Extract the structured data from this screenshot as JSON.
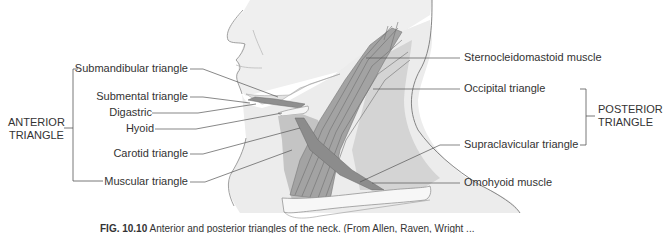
{
  "figure": {
    "groups": {
      "anterior": "ANTERIOR\nTRIANGLE",
      "anterior_line1": "ANTERIOR",
      "anterior_line2": "TRIANGLE",
      "posterior_line1": "POSTERIOR",
      "posterior_line2": "TRIANGLE"
    },
    "left_labels": {
      "submandibular": "Submandibular triangle",
      "submental": "Submental triangle",
      "digastric": "Digastric",
      "hyoid": "Hyoid",
      "carotid": "Carotid triangle",
      "muscular": "Muscular triangle"
    },
    "right_labels": {
      "sternocleidomastoid": "Sternocleidomastoid muscle",
      "occipital": "Occipital triangle",
      "supraclavicular": "Supraclavicular triangle",
      "omohyoid": "Omohyoid muscle"
    },
    "caption": {
      "fig_number": "FIG. 10.10",
      "text": "Anterior and posterior triangles of the neck. (From Allen, Raven, Wright ..."
    },
    "colors": {
      "skin": "#ececec",
      "anterior_fill": "#c9c9c9",
      "posterior_fill": "#d6d6d6",
      "muscle": "#9a9a9a",
      "leader_line": "#555555"
    }
  }
}
